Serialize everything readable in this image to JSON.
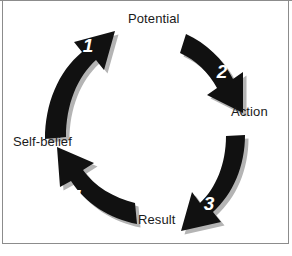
{
  "diagram": {
    "type": "cycle",
    "direction": "clockwise",
    "stage_count": 4,
    "arrow_color": "#111111",
    "shadow_color": "#b0b0b0",
    "label_color": "#1a1a1a",
    "background": "#ffffff",
    "border_color": "#8c8c8c",
    "stages": [
      {
        "number": "1",
        "label": "Potential",
        "position": "top",
        "arrow_position": "upper-left",
        "points_to": "Potential"
      },
      {
        "number": "2",
        "label": "Action",
        "position": "right",
        "arrow_position": "upper-right",
        "points_to": "Action"
      },
      {
        "number": "3",
        "label": "Result",
        "position": "bottom",
        "arrow_position": "lower-right",
        "points_to": "Result"
      },
      {
        "number": "4",
        "label": "Self-belief",
        "position": "left",
        "arrow_position": "lower-left",
        "points_to": "Self-belief"
      }
    ]
  }
}
